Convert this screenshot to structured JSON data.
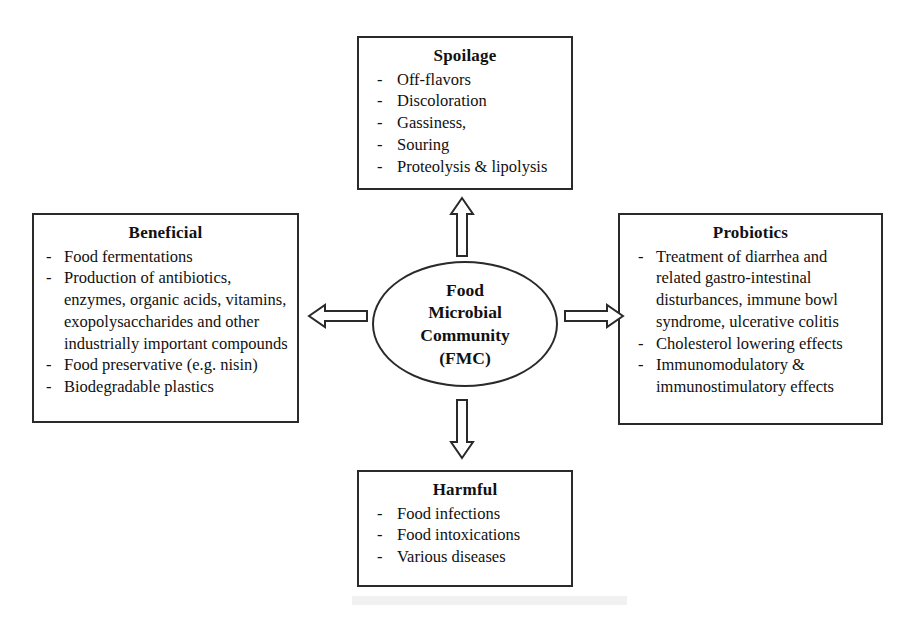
{
  "diagram": {
    "center": {
      "label": "Food\nMicrobial\nCommunity\n(FMC)",
      "shape": "ellipse"
    },
    "nodes": [
      {
        "id": "spoilage",
        "title": "Spoilage",
        "position": "top",
        "items": [
          "Off-flavors",
          "Discoloration",
          "Gassiness,",
          "Souring",
          "Proteolysis & lipolysis"
        ]
      },
      {
        "id": "beneficial",
        "title": "Beneficial",
        "position": "left",
        "items": [
          "Food fermentations",
          "Production of antibiotics, enzymes, organic acids, vitamins, exopolysaccharides and other industrially important compounds",
          "Food preservative (e.g. nisin)",
          "Biodegradable plastics"
        ]
      },
      {
        "id": "probiotics",
        "title": "Probiotics",
        "position": "right",
        "items": [
          "Treatment of diarrhea and related gastro-intestinal disturbances, immune bowl syndrome, ulcerative colitis",
          "Cholesterol lowering effects",
          "Immunomodulatory & immunostimulatory effects"
        ]
      },
      {
        "id": "harmful",
        "title": "Harmful",
        "position": "bottom",
        "items": [
          "Food infections",
          "Food intoxications",
          "Various diseases"
        ]
      }
    ],
    "bullet_marker": "-",
    "arrows": [
      {
        "id": "arrow-up",
        "direction": "up",
        "from": "center",
        "to": "spoilage"
      },
      {
        "id": "arrow-left",
        "direction": "left",
        "from": "center",
        "to": "beneficial"
      },
      {
        "id": "arrow-right",
        "direction": "right",
        "from": "center",
        "to": "probiotics"
      },
      {
        "id": "arrow-down",
        "direction": "down",
        "from": "center",
        "to": "harmful"
      }
    ],
    "colors": {
      "stroke": "#2a2a2a",
      "background": "#ffffff",
      "text": "#111111"
    },
    "caption": ""
  }
}
